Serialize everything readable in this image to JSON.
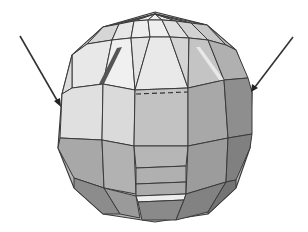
{
  "figure": {
    "background": "#ffffff",
    "palette": {
      "cap_light": "#e6e6e6",
      "cap_mid": "#d4d4d4",
      "cap_dark": "#b4b4b4",
      "band_light": "#dedede",
      "band_mid": "#bdbdbd",
      "band_dark": "#9a9a9a",
      "lower_light": "#aeaeae",
      "lower_dark": "#7e7e7e",
      "edge": "#3a3a3a",
      "highlight_strip": "#f2f2f2",
      "dark_strip": "#555555"
    },
    "annotations": [
      {
        "name": "left-arrow",
        "from": [
          20,
          36
        ],
        "to": [
          60,
          106
        ],
        "color": "#333333"
      },
      {
        "name": "right-arrow",
        "from": [
          293,
          37
        ],
        "to": [
          252,
          91
        ],
        "color": "#333333"
      }
    ]
  }
}
